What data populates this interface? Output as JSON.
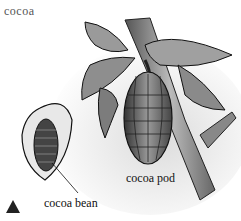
{
  "figure": {
    "title": "cocoa",
    "labels": {
      "bean": "cocoa bean",
      "pod": "cocoa pod"
    },
    "marker": "triangle-icon"
  }
}
